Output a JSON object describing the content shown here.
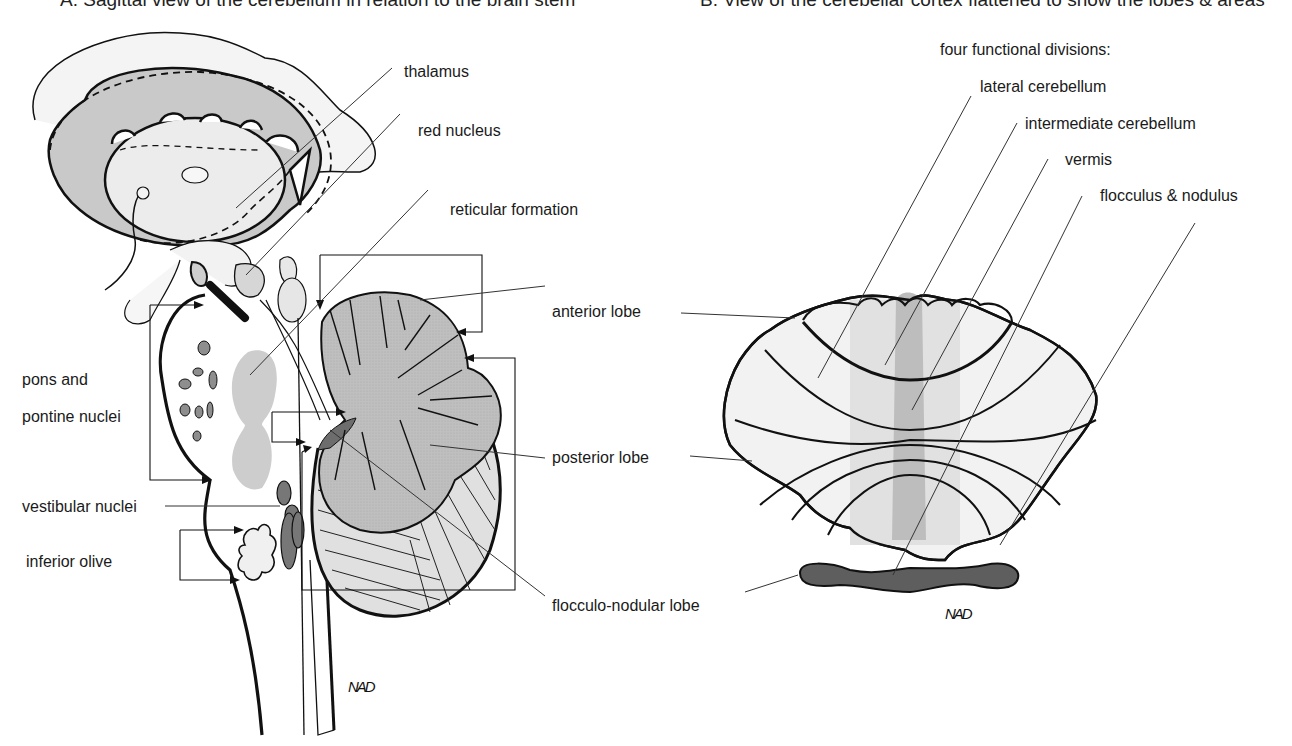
{
  "captions": {
    "left_partial": "A. Sagittal view of the cerebellum in relation to the brain stem",
    "right_partial": "B. View of the cerebellar cortex flattened to show the lobes & areas"
  },
  "panel_a": {
    "labels": {
      "thalamus": "thalamus",
      "red_nucleus": "red nucleus",
      "reticular_formation": "reticular formation",
      "anterior_lobe": "anterior  lobe",
      "pons_line1": "pons and",
      "pons_line2": "pontine nuclei",
      "posterior_lobe": "posterior lobe",
      "vestibular_nuclei": "vestibular nuclei",
      "inferior_olive": "inferior olive",
      "flocculonodular_lobe": "flocculo-nodular lobe"
    },
    "signature": "NAD"
  },
  "panel_b": {
    "heading": "four functional divisions:",
    "divisions": [
      "lateral cerebellum",
      "intermediate cerebellum",
      "vermis",
      "flocculus & nodulus"
    ],
    "signature": "NAD"
  },
  "colors": {
    "outline": "#111111",
    "light_fill": "#efefef",
    "mid_fill": "#c8c8c8",
    "cortex_fill": "#b9b9b9",
    "dark_fill": "#5e5e5e",
    "vermis_fill": "#bdbdbd",
    "intermediate_fill": "#dedede"
  }
}
